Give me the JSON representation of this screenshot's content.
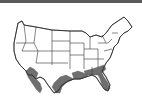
{
  "figure": {
    "type": "range-map",
    "region": "Contiguous United States",
    "colors": {
      "background": "#ffffff",
      "state_border": "#2a2a2a",
      "range_fill": "#6f6f6f",
      "top_rule": "#5a5a5a"
    },
    "shaded_regions": [
      "Southern California / Baja border",
      "Southern Arizona",
      "South Texas",
      "Louisiana",
      "Mississippi",
      "Alabama",
      "Georgia",
      "South Carolina",
      "Florida"
    ]
  }
}
